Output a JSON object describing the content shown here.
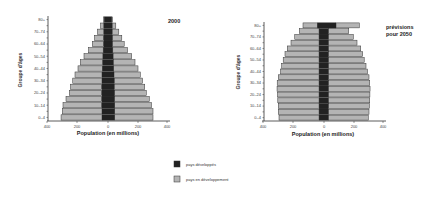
{
  "chart_data": [
    {
      "type": "bar",
      "orientation": "horizontal-pyramid",
      "title": "2000",
      "xlabel": "Population (en millions)",
      "ylabel": "Groupe d'âges",
      "xticks": [
        "400",
        "200",
        "0",
        "200",
        "400"
      ],
      "xlim": [
        -400,
        400
      ],
      "yticks": [
        "0–4",
        "10–14",
        "20–24",
        "30–34",
        "40–44",
        "50–54",
        "60–64",
        "70–74",
        "80+"
      ],
      "categories": [
        "0–4",
        "5–9",
        "10–14",
        "15–19",
        "20–24",
        "25–29",
        "30–34",
        "35–39",
        "40–44",
        "45–49",
        "50–54",
        "55–59",
        "60–64",
        "65–69",
        "70–74",
        "75–79",
        "80+"
      ],
      "series": [
        {
          "name": "pays développés (gauche)",
          "values": [
            40,
            40,
            42,
            42,
            42,
            42,
            40,
            40,
            38,
            36,
            34,
            32,
            30,
            30,
            28,
            28,
            25
          ]
        },
        {
          "name": "pays développés (droite)",
          "values": [
            45,
            45,
            45,
            44,
            44,
            42,
            42,
            40,
            38,
            36,
            34,
            32,
            30,
            30,
            28,
            28,
            25
          ]
        },
        {
          "name": "total gauche",
          "values": [
            313,
            305,
            300,
            280,
            258,
            250,
            235,
            220,
            200,
            185,
            160,
            130,
            105,
            90,
            70,
            50,
            30
          ]
        },
        {
          "name": "total droite",
          "values": [
            300,
            300,
            290,
            275,
            255,
            245,
            230,
            215,
            200,
            180,
            158,
            130,
            108,
            92,
            72,
            52,
            30
          ]
        }
      ]
    },
    {
      "type": "bar",
      "orientation": "horizontal-pyramid",
      "title": "prévisions pour 2050",
      "xlabel": "Population (en millions)",
      "ylabel": "Groupe d'âges",
      "xticks": [
        "400",
        "200",
        "0",
        "200",
        "400"
      ],
      "xlim": [
        -400,
        400
      ],
      "yticks": [
        "0–4",
        "10–14",
        "20–24",
        "30–34",
        "40–44",
        "50–54",
        "60–64",
        "70–74",
        "80+"
      ],
      "categories": [
        "0–4",
        "5–9",
        "10–14",
        "15–19",
        "20–24",
        "25–29",
        "30–34",
        "35–39",
        "40–44",
        "45–49",
        "50–54",
        "55–59",
        "60–64",
        "65–69",
        "70–74",
        "75–79",
        "80+"
      ],
      "series": [
        {
          "name": "pays développés (gauche)",
          "values": [
            33,
            33,
            33,
            33,
            33,
            33,
            33,
            33,
            33,
            33,
            33,
            33,
            33,
            33,
            33,
            33,
            45
          ]
        },
        {
          "name": "pays développés (droite)",
          "values": [
            30,
            30,
            30,
            30,
            30,
            30,
            30,
            30,
            30,
            30,
            30,
            30,
            30,
            30,
            30,
            30,
            80
          ]
        },
        {
          "name": "total gauche",
          "values": [
            300,
            305,
            305,
            308,
            310,
            313,
            312,
            305,
            290,
            282,
            272,
            260,
            245,
            220,
            195,
            165,
            140
          ]
        },
        {
          "name": "total droite",
          "values": [
            295,
            300,
            303,
            305,
            306,
            307,
            305,
            300,
            290,
            280,
            268,
            258,
            245,
            220,
            195,
            165,
            235
          ]
        }
      ]
    }
  ],
  "legend": {
    "items": [
      {
        "label": "pays développés",
        "color": "#222222"
      },
      {
        "label": "pays en développement",
        "color": "#b4b4b4"
      }
    ]
  },
  "colors": {
    "developed": "#222222",
    "developing": "#b4b4b4",
    "outline": "#333333"
  }
}
